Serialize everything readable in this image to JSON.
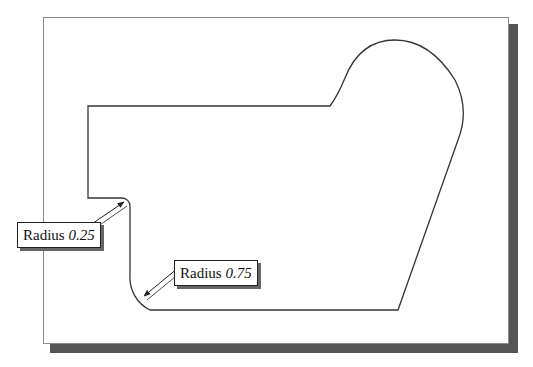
{
  "drawing": {
    "frame_color": "#8a8a8a",
    "shadow_color": "#555555",
    "outline_color": "#333333"
  },
  "callouts": [
    {
      "label": "Radius",
      "value": "0.25"
    },
    {
      "label": "Radius",
      "value": "0.75"
    }
  ]
}
